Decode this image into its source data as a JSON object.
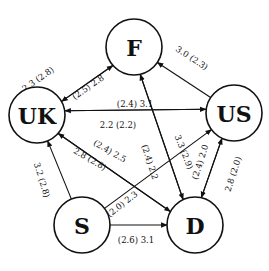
{
  "diagram": {
    "type": "directed-graph",
    "nodes": [
      {
        "id": "F",
        "label": "F",
        "x": 134,
        "y": 47,
        "r": 28
      },
      {
        "id": "US",
        "label": "US",
        "x": 234,
        "y": 113,
        "r": 28
      },
      {
        "id": "UK",
        "label": "UK",
        "x": 37,
        "y": 115,
        "r": 28
      },
      {
        "id": "S",
        "label": "S",
        "x": 82,
        "y": 225,
        "r": 28
      },
      {
        "id": "D",
        "label": "D",
        "x": 195,
        "y": 225,
        "r": 28
      }
    ],
    "edges": [
      {
        "from": "F",
        "to": "UK",
        "label": "2.3 (2.8)",
        "offset": -3,
        "lx": 38,
        "ly": 79,
        "angle": -35
      },
      {
        "from": "UK",
        "to": "F",
        "label": "(2.5) 2.8",
        "offset": 3,
        "lx": 88,
        "ly": 87,
        "angle": -35
      },
      {
        "from": "US",
        "to": "F",
        "label": "3.0 (2.3)",
        "offset": 0,
        "lx": 192,
        "ly": 58,
        "angle": 33
      },
      {
        "from": "UK",
        "to": "US",
        "label": "(2.4) 3.1",
        "offset": -4,
        "lx": 135,
        "ly": 104,
        "angle": 0
      },
      {
        "from": "US",
        "to": "UK",
        "label": "2.2 (2.2)",
        "offset": 4,
        "lx": 118,
        "ly": 125,
        "angle": 0
      },
      {
        "from": "D",
        "to": "UK",
        "label": "(2.4) 2.5",
        "offset": -3,
        "lx": 110,
        "ly": 151,
        "angle": 30
      },
      {
        "from": "UK",
        "to": "D",
        "label": "2.8 (2.8)",
        "offset": 3,
        "lx": 90,
        "ly": 159,
        "angle": 30
      },
      {
        "from": "D",
        "to": "F",
        "label": "(2.4) 2.2",
        "offset": -3,
        "lx": 150,
        "ly": 162,
        "angle": 72
      },
      {
        "from": "F",
        "to": "D",
        "label": "",
        "offset": 3,
        "lx": 0,
        "ly": 0,
        "angle": 0
      },
      {
        "from": "S",
        "to": "US",
        "label": "(2.0) 2.3",
        "offset": 0,
        "lx": 122,
        "ly": 204,
        "angle": -38
      },
      {
        "from": "S",
        "to": "US",
        "label": "3.3 (2.9)",
        "offset": 0,
        "lx": 184,
        "ly": 152,
        "angle": 68,
        "label_only": true
      },
      {
        "from": "D",
        "to": "US",
        "label": "(2.4) 2.0",
        "offset": -3,
        "lx": 200,
        "ly": 162,
        "angle": -72
      },
      {
        "from": "US",
        "to": "D",
        "label": "2.8 (2.0)",
        "offset": 3,
        "lx": 233,
        "ly": 174,
        "angle": -72
      },
      {
        "from": "S",
        "to": "UK",
        "label": "3.2 (2.8)",
        "offset": 0,
        "lx": 42,
        "ly": 180,
        "angle": 73
      },
      {
        "from": "S",
        "to": "D",
        "label": "(2.6) 3.1",
        "offset": 0,
        "lx": 136,
        "ly": 240,
        "angle": 0
      }
    ]
  }
}
